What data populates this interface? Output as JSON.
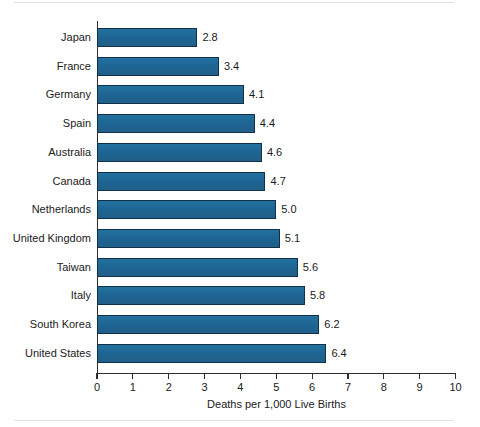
{
  "chart_data": {
    "type": "bar",
    "orientation": "horizontal",
    "title": "",
    "xlabel": "Deaths per 1,000 Live Births",
    "ylabel": "",
    "categories": [
      "Japan",
      "France",
      "Germany",
      "Spain",
      "Australia",
      "Canada",
      "Netherlands",
      "United Kingdom",
      "Taiwan",
      "Italy",
      "South Korea",
      "United States"
    ],
    "values": [
      2.8,
      3.4,
      4.1,
      4.4,
      4.6,
      4.7,
      5.0,
      5.1,
      5.6,
      5.8,
      6.2,
      6.4
    ],
    "value_labels": [
      "2.8",
      "3.4",
      "4.1",
      "4.4",
      "4.6",
      "4.7",
      "5.0",
      "5.1",
      "5.6",
      "5.8",
      "6.2",
      "6.4"
    ],
    "xlim": [
      0,
      10
    ],
    "xticks": [
      0,
      1,
      2,
      3,
      4,
      5,
      6,
      7,
      8,
      9,
      10
    ],
    "xtick_labels": [
      "0",
      "1",
      "2",
      "3",
      "4",
      "5",
      "6",
      "7",
      "8",
      "9",
      "10"
    ],
    "grid": false,
    "legend": false,
    "bar_fill_color": "#1f6a99",
    "bar_border_color": "#123049",
    "axis_color": "#2d2d2d",
    "background_color": "#ffffff"
  }
}
